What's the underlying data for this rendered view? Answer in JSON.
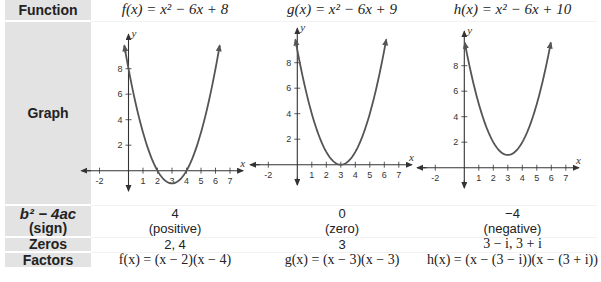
{
  "row_labels": {
    "function": "Function",
    "graph": "Graph",
    "discriminant_line1": "b² − 4ac",
    "discriminant_line2": "(sign)",
    "zeros": "Zeros",
    "factors": "Factors"
  },
  "columns": [
    {
      "name": "f",
      "function": "f(x) = x² − 6x + 8",
      "discriminant": "4",
      "sign": "(positive)",
      "zeros": "2, 4",
      "factors": "f(x) = (x − 2)(x − 4)"
    },
    {
      "name": "g",
      "function": "g(x) = x² − 6x + 9",
      "discriminant": "0",
      "sign": "(zero)",
      "zeros": "3",
      "factors": "g(x) = (x − 3)(x − 3)"
    },
    {
      "name": "h",
      "function": "h(x) = x² − 6x + 10",
      "discriminant": "−4",
      "sign": "(negative)",
      "zeros": "3 − i, 3 + i",
      "factors": "h(x) = (x − (3 − i))(x − (3 + i))"
    }
  ],
  "axis": {
    "x_label": "x",
    "y_label": "y",
    "x_ticks": [
      "-2",
      "1",
      "2",
      "3",
      "4",
      "5",
      "6",
      "7"
    ],
    "y_ticks": [
      "2",
      "4",
      "6",
      "8"
    ]
  },
  "colors": {
    "label_bg": "#e3e3e3",
    "curve": "#555555",
    "axis": "#333333"
  },
  "chart_data": [
    {
      "type": "line",
      "title": "f(x) = x² − 6x + 8",
      "xlabel": "x",
      "ylabel": "y",
      "x": [
        -0.1,
        0,
        1,
        2,
        3,
        4,
        5,
        6,
        6.1
      ],
      "values": [
        8.61,
        8,
        3,
        0,
        -1,
        0,
        3,
        8,
        8.61
      ],
      "xlim": [
        -3,
        8
      ],
      "ylim": [
        -1.5,
        10
      ],
      "x_ticks": [
        -2,
        1,
        2,
        3,
        4,
        5,
        6,
        7
      ],
      "y_ticks": [
        2,
        4,
        6,
        8
      ],
      "grid": false
    },
    {
      "type": "line",
      "title": "g(x) = x² − 6x + 9",
      "xlabel": "x",
      "ylabel": "y",
      "x": [
        0,
        1,
        2,
        3,
        4,
        5,
        6
      ],
      "values": [
        9,
        4,
        1,
        0,
        1,
        4,
        9
      ],
      "xlim": [
        -3,
        8
      ],
      "ylim": [
        -1.5,
        10
      ],
      "x_ticks": [
        -2,
        1,
        2,
        3,
        4,
        5,
        6,
        7
      ],
      "y_ticks": [
        2,
        4,
        6,
        8
      ],
      "grid": false
    },
    {
      "type": "line",
      "title": "h(x) = x² − 6x + 10",
      "xlabel": "x",
      "ylabel": "y",
      "x": [
        0,
        1,
        2,
        3,
        4,
        5,
        6
      ],
      "values": [
        10,
        5,
        2,
        1,
        2,
        5,
        10
      ],
      "xlim": [
        -3,
        8
      ],
      "ylim": [
        -1.5,
        10
      ],
      "x_ticks": [
        -2,
        1,
        2,
        3,
        4,
        5,
        6,
        7
      ],
      "y_ticks": [
        2,
        4,
        6,
        8
      ],
      "grid": false
    }
  ]
}
